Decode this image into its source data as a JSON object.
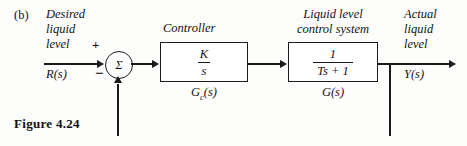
{
  "figure": {
    "part_label": "(b)",
    "caption": "Figure 4.24"
  },
  "input_signal": {
    "description_lines": [
      "Desired",
      "liquid",
      "level"
    ],
    "symbol": "R(s)"
  },
  "output_signal": {
    "description_lines": [
      "Actual",
      "liquid",
      "level"
    ],
    "symbol": "Y(s)"
  },
  "summing_junction": {
    "symbol": "Σ",
    "positive_sign": "+",
    "negative_sign": "−"
  },
  "blocks": [
    {
      "name": "controller",
      "header": "Controller",
      "transfer_function": {
        "numerator": "K",
        "denominator": "s"
      },
      "sublabel_main": "G",
      "sublabel_sub": "c",
      "sublabel_tail": "(s)"
    },
    {
      "name": "plant",
      "header_lines": [
        "Liquid level",
        "control system"
      ],
      "transfer_function": {
        "numerator": "1",
        "denominator": "Ts + 1"
      },
      "sublabel_main": "G",
      "sublabel_sub": "",
      "sublabel_tail": "(s)"
    }
  ],
  "colors": {
    "ink": "#1a1a1a",
    "background": "#fdfdfc"
  }
}
